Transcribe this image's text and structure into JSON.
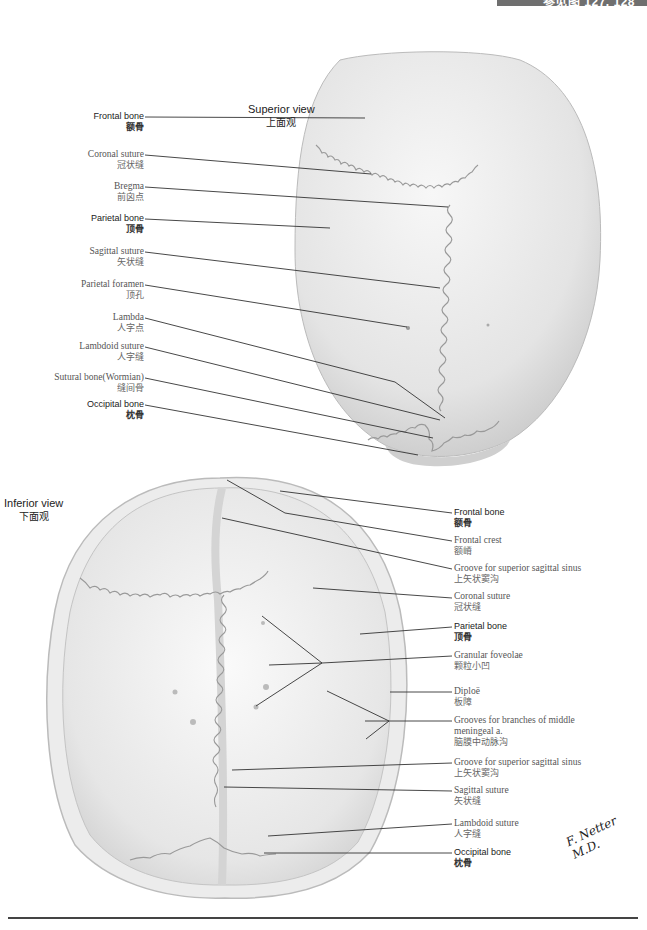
{
  "header": {
    "reference": "参见图 127, 128",
    "bar_color": "#6f6f6f"
  },
  "superior_view": {
    "title_en": "Superior view",
    "title_zh": "上面观",
    "labels": [
      {
        "en": "Frontal bone",
        "zh": "额骨",
        "style": "sans"
      },
      {
        "en": "Coronal suture",
        "zh": "冠状缝",
        "style": "serif"
      },
      {
        "en": "Bregma",
        "zh": "前囟点",
        "style": "serif"
      },
      {
        "en": "Parietal bone",
        "zh": "顶骨",
        "style": "sans"
      },
      {
        "en": "Sagittal suture",
        "zh": "矢状缝",
        "style": "serif"
      },
      {
        "en": "Parietal foramen",
        "zh": "顶孔",
        "style": "serif"
      },
      {
        "en": "Lambda",
        "zh": "人字点",
        "style": "serif"
      },
      {
        "en": "Lambdoid suture",
        "zh": "人字缝",
        "style": "serif"
      },
      {
        "en": "Sutural bone(Wormian)",
        "zh": "缝间骨",
        "style": "serif"
      },
      {
        "en": "Occipital bone",
        "zh": "枕骨",
        "style": "sans"
      }
    ]
  },
  "inferior_view": {
    "title_en": "Inferior view",
    "title_zh": "下面观",
    "labels": [
      {
        "en": "Frontal bone",
        "zh": "额骨",
        "style": "sans"
      },
      {
        "en": "Frontal crest",
        "zh": "额嵴",
        "style": "serif"
      },
      {
        "en": "Groove for superior sagittal sinus",
        "zh": "上矢状窦沟",
        "style": "serif"
      },
      {
        "en": "Coronal suture",
        "zh": "冠状缝",
        "style": "serif"
      },
      {
        "en": "Parietal bone",
        "zh": "顶骨",
        "style": "sans"
      },
      {
        "en": "Granular foveolae",
        "zh": "颗粒小凹",
        "style": "serif"
      },
      {
        "en": "Diploë",
        "zh": "板障",
        "style": "serif"
      },
      {
        "en": "Grooves for branches of middle",
        "en2": "meningeal a.",
        "zh": "脑膜中动脉沟",
        "style": "serif"
      },
      {
        "en": "Groove for superior sagittal sinus",
        "zh": "上矢状窦沟",
        "style": "serif"
      },
      {
        "en": "Sagittal suture",
        "zh": "矢状缝",
        "style": "serif"
      },
      {
        "en": "Lambdoid suture",
        "zh": "人字缝",
        "style": "serif"
      },
      {
        "en": "Occipital bone",
        "zh": "枕骨",
        "style": "sans"
      }
    ]
  },
  "signature": "F. Netter M.D."
}
